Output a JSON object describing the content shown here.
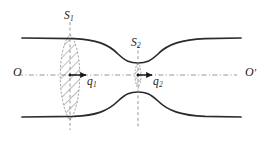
{
  "figure": {
    "kind": "venturi-channel-flux-diagram",
    "background_color": "#ffffff",
    "curve_color": "#2b2b2b",
    "dash_color": "#8a8a8a",
    "hatch_color": "#6e6e6e",
    "arrow_color": "#1b1b1b",
    "labels": {
      "axis_left": "O",
      "axis_right": "O",
      "axis_right_prime": "′",
      "section_1": "S",
      "section_1_sub": "1",
      "section_2": "S",
      "section_2_sub": "2",
      "flow_1": "q",
      "flow_1_sub": "1",
      "flow_2": "q",
      "flow_2_sub": "2"
    },
    "geometry": {
      "width": 267,
      "height": 141,
      "axis_y": 75,
      "axis_x_start": 18,
      "axis_x_end": 237,
      "wall_x_start": 22,
      "wall_x_end": 241,
      "wall_top_y_wide": 38,
      "wall_bottom_y_wide": 117,
      "throat_x": 138,
      "throat_top_y": 63,
      "throat_bottom_y": 88,
      "section_1_x": 70,
      "section_1_dash_top": 22,
      "section_1_dash_bottom": 130,
      "section_2_x": 138,
      "section_2_dash_top": 45,
      "section_2_dash_bottom": 128,
      "lens_half_width": 13,
      "throat_strip_half_width": 4
    },
    "arrows": [
      {
        "name": "q1-arrow",
        "x_start": 71,
        "x_end": 86,
        "y": 75
      },
      {
        "name": "q2-arrow",
        "x_start": 139,
        "x_end": 152,
        "y": 75
      }
    ]
  }
}
